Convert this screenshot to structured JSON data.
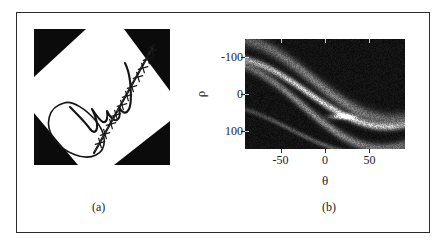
{
  "figure": {
    "panels": [
      {
        "id": "a",
        "caption": "(a)",
        "kind": "image",
        "description": "binary signature image with four black corner triangles and a marked straight stroke"
      },
      {
        "id": "b",
        "caption": "(b)",
        "kind": "heatmap",
        "description": "Hough / Radon transform accumulator of the signature image"
      }
    ]
  },
  "chart_data": {
    "type": "heatmap",
    "title": "",
    "subtitle": "",
    "xlabel": "θ",
    "ylabel": "ρ",
    "xlim": [
      -90,
      90
    ],
    "ylim": [
      -150,
      150
    ],
    "y_inverted": true,
    "grid": false,
    "legend": null,
    "colormap": "gray",
    "x_ticks": [
      -50,
      0,
      50
    ],
    "x_ticklabels": [
      "-50",
      "0",
      "50"
    ],
    "y_ticks": [
      -100,
      0,
      100
    ],
    "y_ticklabels": [
      "-100",
      "0",
      "100"
    ],
    "annotations": [
      {
        "text": "bright compact accumulator peak",
        "theta": 20,
        "rho": 62
      }
    ],
    "sinusoid_bands": [
      {
        "name": "long-straight-stroke band",
        "amplitude": 95,
        "phase_deg": 20,
        "offset": -5,
        "intensity": 0.85,
        "thickness": 7
      },
      {
        "name": "loop-upper band",
        "amplitude": 110,
        "phase_deg": 14,
        "offset": -40,
        "intensity": 0.45,
        "thickness": 12
      },
      {
        "name": "loop-lower band",
        "amplitude": 118,
        "phase_deg": 26,
        "offset": 30,
        "intensity": 0.5,
        "thickness": 9
      },
      {
        "name": "faint-lower-arc",
        "amplitude": 70,
        "phase_deg": 40,
        "offset": 95,
        "intensity": 0.3,
        "thickness": 5
      }
    ]
  },
  "panel_a_graphic": {
    "background": "#ffffff",
    "ink_color": "#0b0b0b",
    "corner_fill": "#0b0b0b",
    "triangles": [
      {
        "name": "top-left"
      },
      {
        "name": "top-right"
      },
      {
        "name": "bottom-left"
      },
      {
        "name": "bottom-right"
      }
    ],
    "marker_symbol": "x",
    "marker_count": 12
  },
  "colors": {
    "frame_border": "#2b2b2b",
    "page_background": "#ffffff",
    "plot_background": "#080808",
    "text": "#1d1d1d",
    "ink": "#0b0b0b"
  }
}
